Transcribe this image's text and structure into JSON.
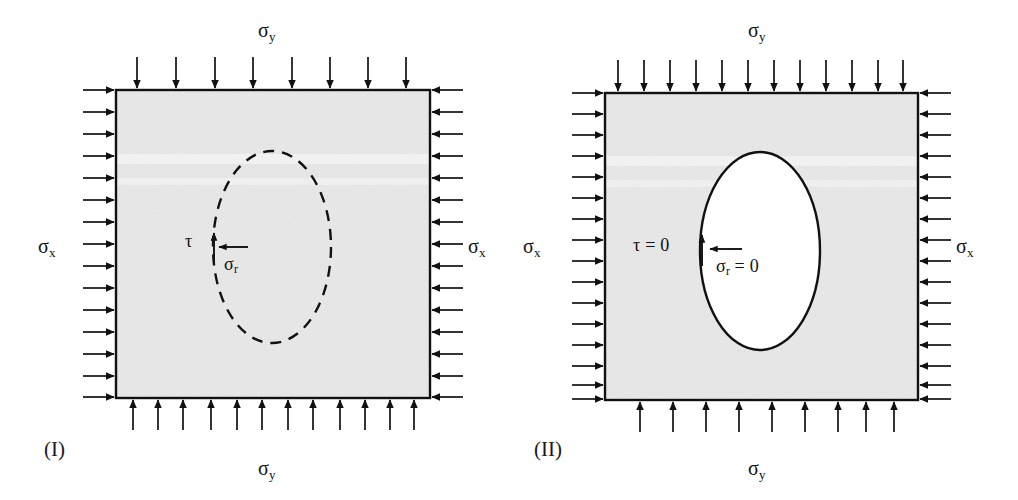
{
  "figure": {
    "background_color": "#ffffff",
    "plate_fill_color": "#e8e8e8",
    "plate_edge_color": "#111111",
    "arrow_color": "#111111",
    "text_color": "#111111"
  },
  "panels": [
    {
      "id": "I",
      "caption": "(I)",
      "hole_style": "dashed",
      "hole_description": "dashed elliptical outline, material present",
      "plate": {
        "x": 116,
        "y": 90,
        "width": 314,
        "height": 308
      },
      "ellipse": {
        "cx": 272,
        "cy": 247,
        "rx": 59,
        "ry": 96
      },
      "labels": {
        "top": {
          "symbol": "σ",
          "subscript": "y",
          "text": "σy"
        },
        "bottom": {
          "symbol": "σ",
          "subscript": "y",
          "text": "σy"
        },
        "left": {
          "symbol": "σ",
          "subscript": "x",
          "text": "σx"
        },
        "right": {
          "symbol": "σ",
          "subscript": "x",
          "text": "σx"
        },
        "shear": {
          "symbol": "τ",
          "subscript": "",
          "text": "τ"
        },
        "radial": {
          "symbol": "σ",
          "subscript": "r",
          "text": "σr"
        }
      },
      "arrow_counts": {
        "top": 8,
        "bottom": 12,
        "left": 15,
        "right": 15
      }
    },
    {
      "id": "II",
      "caption": "(II)",
      "hole_style": "solid",
      "hole_description": "solid elliptical hole, traction free boundary",
      "plate": {
        "x": 605,
        "y": 93,
        "width": 313,
        "height": 307
      },
      "ellipse": {
        "cx": 760,
        "cy": 251,
        "rx": 60,
        "ry": 99
      },
      "labels": {
        "top": {
          "symbol": "σ",
          "subscript": "y",
          "text": "σy"
        },
        "bottom": {
          "symbol": "σ",
          "subscript": "y",
          "text": "σy"
        },
        "left": {
          "symbol": "σ",
          "subscript": "x",
          "text": "σx"
        },
        "right": {
          "symbol": "σ",
          "subscript": "x",
          "text": "σx"
        },
        "shear": {
          "symbol": "τ",
          "subscript": "",
          "text": "τ = 0",
          "value": "0"
        },
        "radial": {
          "symbol": "σ",
          "subscript": "r",
          "text": "σr = 0",
          "value": "0"
        }
      },
      "arrow_counts": {
        "top": 12,
        "bottom": 9,
        "left": 16,
        "right": 16
      }
    }
  ],
  "text": {
    "panel1_caption": "(I)",
    "panel1_sigma_y_top": "σ",
    "panel1_sigma_y_top_sub": "y",
    "panel1_sigma_y_bottom": "σ",
    "panel1_sigma_y_bottom_sub": "y",
    "panel1_sigma_x_left": "σ",
    "panel1_sigma_x_left_sub": "x",
    "panel1_sigma_x_right": "σ",
    "panel1_sigma_x_right_sub": "x",
    "panel1_tau": "τ",
    "panel1_sigma_r": "σ",
    "panel1_sigma_r_sub": "r",
    "panel2_caption": "(II)",
    "panel2_sigma_y_top": "σ",
    "panel2_sigma_y_top_sub": "y",
    "panel2_sigma_y_bottom": "σ",
    "panel2_sigma_y_bottom_sub": "y",
    "panel2_sigma_x_left": "σ",
    "panel2_sigma_x_left_sub": "x",
    "panel2_sigma_x_right": "σ",
    "panel2_sigma_x_right_sub": "x",
    "panel2_tau": "τ = 0",
    "panel2_sigma_r": "σ",
    "panel2_sigma_r_sub": "r",
    "panel2_sigma_r_eq": " = 0"
  }
}
